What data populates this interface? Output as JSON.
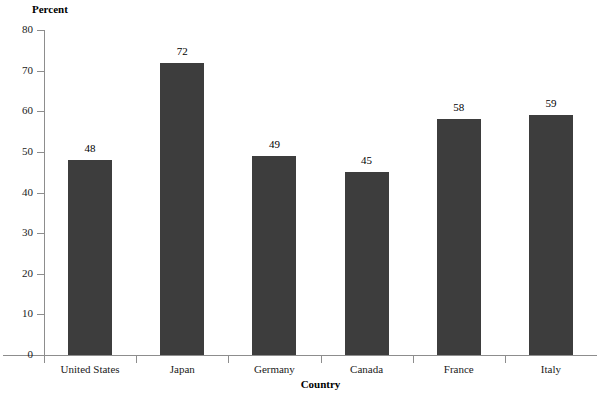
{
  "chart_data": {
    "type": "bar",
    "title": "",
    "subtitle": "",
    "categories": [
      "United States",
      "Japan",
      "Germany",
      "Canada",
      "France",
      "Italy"
    ],
    "values": [
      48,
      72,
      49,
      45,
      58,
      59
    ],
    "value_labels": [
      "48",
      "72",
      "49",
      "45",
      "58",
      "59"
    ],
    "xlabel": "Country",
    "ylabel": "Percent",
    "ylim": [
      0,
      80
    ],
    "yticks": [
      0,
      10,
      20,
      30,
      40,
      50,
      60,
      70,
      80
    ],
    "ytick_labels": [
      "0",
      "10",
      "20",
      "30",
      "40",
      "50",
      "60",
      "70",
      "80"
    ],
    "grid": false,
    "legend": false,
    "legend_position": "none",
    "bar_color": "#3d3d3d",
    "axis_color": "#8d8d8d",
    "background_color": "#ffffff"
  }
}
